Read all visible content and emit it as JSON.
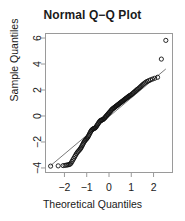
{
  "chart_data": {
    "type": "scatter",
    "title": "Normal Q−Q Plot",
    "xlabel": "Theoretical Quantiles",
    "ylabel": "Sample Quantiles",
    "xlim": [
      -2.85,
      2.85
    ],
    "ylim": [
      -4.35,
      6.35
    ],
    "xticks": [
      -2,
      -1,
      0,
      1,
      2
    ],
    "xticklabels": [
      "−2",
      "−1",
      "0",
      "1",
      "2"
    ],
    "yticks": [
      -4,
      -2,
      0,
      2,
      4,
      6
    ],
    "yticklabels": [
      "−4",
      "−2",
      "0",
      "2",
      "4",
      "6"
    ],
    "grid": false,
    "legend": null,
    "point_style": {
      "marker": "open-circle",
      "radius": 2.1,
      "stroke": "#111111",
      "fill": "none"
    },
    "reference_line": {
      "name": "qqline",
      "color": "#555555",
      "width": 0.8,
      "x1": -2.62,
      "y1": -3.82,
      "x2": 2.55,
      "y2": 3.62
    },
    "frame_color": "#9a9a9a",
    "series": [
      {
        "name": "sample-quantiles",
        "x": [
          -2.62,
          -2.28,
          -2.06,
          -1.97,
          -1.9,
          -1.84,
          -1.79,
          -1.74,
          -1.7,
          -1.66,
          -1.62,
          -1.58,
          -1.54,
          -1.5,
          -1.46,
          -1.42,
          -1.38,
          -1.34,
          -1.3,
          -1.27,
          -1.24,
          -1.21,
          -1.18,
          -1.15,
          -1.12,
          -1.09,
          -1.06,
          -1.03,
          -1.0,
          -0.97,
          -0.94,
          -0.91,
          -0.88,
          -0.85,
          -0.82,
          -0.79,
          -0.76,
          -0.73,
          -0.7,
          -0.67,
          -0.64,
          -0.61,
          -0.58,
          -0.55,
          -0.52,
          -0.49,
          -0.46,
          -0.43,
          -0.4,
          -0.37,
          -0.34,
          -0.31,
          -0.28,
          -0.25,
          -0.22,
          -0.19,
          -0.16,
          -0.13,
          -0.1,
          -0.07,
          -0.04,
          -0.01,
          0.02,
          0.05,
          0.08,
          0.11,
          0.14,
          0.17,
          0.2,
          0.23,
          0.26,
          0.29,
          0.32,
          0.35,
          0.38,
          0.41,
          0.44,
          0.47,
          0.5,
          0.53,
          0.56,
          0.59,
          0.62,
          0.65,
          0.68,
          0.71,
          0.74,
          0.77,
          0.8,
          0.83,
          0.86,
          0.89,
          0.92,
          0.96,
          1.0,
          1.04,
          1.08,
          1.12,
          1.16,
          1.2,
          1.24,
          1.28,
          1.33,
          1.38,
          1.43,
          1.48,
          1.53,
          1.59,
          1.65,
          1.71,
          1.78,
          1.86,
          1.95,
          2.05,
          2.18,
          2.35,
          2.55
        ],
        "y": [
          -3.86,
          -3.84,
          -3.82,
          -3.8,
          -3.78,
          -3.76,
          -3.74,
          -3.7,
          -3.62,
          -3.5,
          -3.38,
          -3.26,
          -3.14,
          -3.02,
          -2.9,
          -2.8,
          -2.72,
          -2.64,
          -2.56,
          -2.48,
          -2.4,
          -2.3,
          -2.2,
          -2.1,
          -2.0,
          -1.92,
          -1.86,
          -1.8,
          -1.74,
          -1.68,
          -1.6,
          -1.5,
          -1.4,
          -1.3,
          -1.2,
          -1.12,
          -1.06,
          -1.02,
          -0.98,
          -0.96,
          -0.94,
          -0.9,
          -0.84,
          -0.76,
          -0.68,
          -0.6,
          -0.52,
          -0.44,
          -0.38,
          -0.34,
          -0.32,
          -0.3,
          -0.28,
          -0.24,
          -0.2,
          -0.14,
          -0.08,
          -0.02,
          0.04,
          0.1,
          0.16,
          0.22,
          0.28,
          0.34,
          0.4,
          0.46,
          0.52,
          0.56,
          0.6,
          0.64,
          0.68,
          0.72,
          0.76,
          0.8,
          0.84,
          0.88,
          0.92,
          0.96,
          1.0,
          1.04,
          1.08,
          1.12,
          1.16,
          1.2,
          1.24,
          1.28,
          1.32,
          1.36,
          1.4,
          1.44,
          1.48,
          1.52,
          1.56,
          1.6,
          1.64,
          1.7,
          1.76,
          1.82,
          1.88,
          1.94,
          2.0,
          2.06,
          2.12,
          2.2,
          2.28,
          2.36,
          2.44,
          2.52,
          2.6,
          2.66,
          2.72,
          2.78,
          2.84,
          2.9,
          2.98,
          4.38,
          5.82
        ]
      }
    ]
  }
}
